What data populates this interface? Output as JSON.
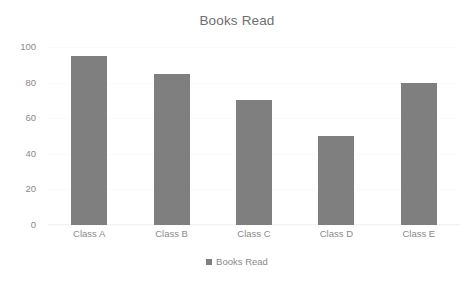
{
  "chart_data": {
    "type": "bar",
    "title": "Books Read",
    "categories": [
      "Class A",
      "Class B",
      "Class C",
      "Class D",
      "Class E"
    ],
    "values": [
      95,
      85,
      70,
      50,
      80
    ],
    "series": [
      {
        "name": "Books Read",
        "values": [
          95,
          85,
          70,
          50,
          80
        ]
      }
    ],
    "xlabel": "",
    "ylabel": "",
    "ylim": [
      0,
      100
    ],
    "y_ticks": [
      0,
      20,
      40,
      60,
      80,
      100
    ],
    "y_tick_labels": [
      "0",
      "20",
      "40",
      "60",
      "80",
      "100"
    ],
    "grid": true,
    "legend": {
      "position": "bottom",
      "entries": [
        "Books Read"
      ]
    },
    "colors": {
      "bar": "#7f7f7f",
      "text": "#8a8a8a",
      "title": "#6e6e6e",
      "background": "#ffffff",
      "gridline": "#fbfbfb"
    }
  },
  "legend": {
    "label": "Books Read",
    "swatch_icon": "square-marker-icon"
  }
}
